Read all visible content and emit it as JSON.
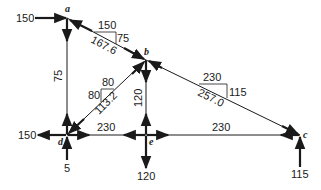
{
  "diagram": {
    "nodes": [
      {
        "id": "a",
        "label": "a"
      },
      {
        "id": "b",
        "label": "b"
      },
      {
        "id": "c",
        "label": "c"
      },
      {
        "id": "d",
        "label": "d"
      },
      {
        "id": "e",
        "label": "e"
      }
    ],
    "members": [
      {
        "from": "a",
        "to": "b",
        "force": "167.6",
        "slope_run": "150",
        "slope_rise": "75"
      },
      {
        "from": "b",
        "to": "c",
        "force": "257.0",
        "slope_run": "230",
        "slope_rise": "115"
      },
      {
        "from": "d",
        "to": "b",
        "force": "113.2",
        "slope_run": "80",
        "slope_rise": "80"
      },
      {
        "from": "a",
        "to": "d",
        "force": "75"
      },
      {
        "from": "b",
        "to": "e",
        "force": "120"
      },
      {
        "from": "d",
        "to": "e",
        "force": "230"
      },
      {
        "from": "e",
        "to": "c",
        "force": "230"
      }
    ],
    "external_loads": {
      "a_horizontal": "150",
      "d_horizontal": "150",
      "d_vertical": "5",
      "e_vertical": "120",
      "c_vertical": "115"
    }
  },
  "colors": {
    "line": "#1a1a1a",
    "background": "#ffffff"
  }
}
